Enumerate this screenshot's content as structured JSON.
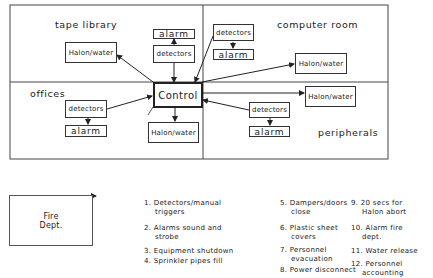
{
  "diagram": {
    "zones": [
      {
        "id": "tape_library",
        "label": "tape library"
      },
      {
        "id": "computer_room",
        "label": "computer room"
      },
      {
        "id": "offices",
        "label": "offices"
      },
      {
        "id": "peripherals",
        "label": "peripherals"
      }
    ],
    "control": {
      "label": "Control"
    },
    "nodes": {
      "tape_halon": "Halon/water",
      "center_alarm": "alarm",
      "center_detectors": "detectors",
      "computer_detectors": "detectors",
      "computer_alarm": "alarm",
      "computer_halon": "Halon/water",
      "offices_detectors": "detectors",
      "offices_alarm": "alarm",
      "control_halon": "Halon/water",
      "peripherals_halon": "Halon/water",
      "peripherals_detectors": "detectors",
      "peripherals_alarm": "alarm"
    },
    "fire_dept": {
      "line1": "Fire",
      "line2": "Dept."
    },
    "legend": [
      {
        "num": "1.",
        "line1": "Detectors/manual",
        "line2": "triggers"
      },
      {
        "num": "2.",
        "line1": "Alarms sound and",
        "line2": "strobe"
      },
      {
        "num": "3.",
        "line1": "Equipment shutdown",
        "line2": ""
      },
      {
        "num": "4.",
        "line1": "Sprinkler pipes fill",
        "line2": ""
      },
      {
        "num": "5.",
        "line1": "Dampers/doors",
        "line2": "close"
      },
      {
        "num": "6.",
        "line1": "Plastic sheet",
        "line2": "covers"
      },
      {
        "num": "7.",
        "line1": "Personnel",
        "line2": "evacuation"
      },
      {
        "num": "8.",
        "line1": "Power disconnect",
        "line2": ""
      },
      {
        "num": "9.",
        "line1": "20 secs for",
        "line2": "Halon abort"
      },
      {
        "num": "10.",
        "line1": "Alarm fire",
        "line2": "dept."
      },
      {
        "num": "11.",
        "line1": "Water release",
        "line2": ""
      },
      {
        "num": "12.",
        "line1": "Personnel",
        "line2": "accounting"
      }
    ],
    "colors": {
      "line": "#333333",
      "background": "#ffffff"
    }
  }
}
